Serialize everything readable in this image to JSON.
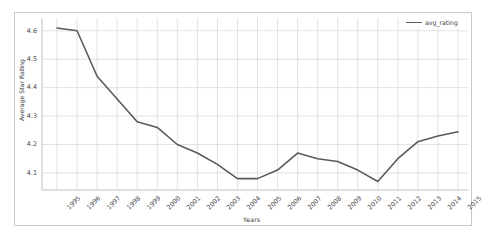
{
  "chart_data": {
    "type": "line",
    "title": "",
    "xlabel": "Years",
    "ylabel": "Average Star Rating",
    "categories": [
      "1995",
      "1996",
      "1997",
      "1998",
      "1999",
      "2000",
      "2001",
      "2002",
      "2003",
      "2004",
      "2005",
      "2006",
      "2007",
      "2008",
      "2009",
      "2010",
      "2011",
      "2012",
      "2013",
      "2014",
      "2015"
    ],
    "series": [
      {
        "name": "avg_rating",
        "color": "#5a5a5a",
        "values": [
          4.61,
          4.6,
          4.44,
          4.36,
          4.28,
          4.26,
          4.2,
          4.17,
          4.13,
          4.08,
          4.08,
          4.11,
          4.17,
          4.15,
          4.14,
          4.11,
          4.07,
          4.15,
          4.21,
          4.23,
          4.245
        ]
      }
    ],
    "ylim": [
      4.04,
      4.645
    ],
    "yticks": [
      4.1,
      4.2,
      4.3,
      4.4,
      4.5,
      4.6
    ],
    "ytick_labels": [
      "4.1",
      "4.2",
      "4.3",
      "4.4",
      "4.5",
      "4.6"
    ],
    "grid": true,
    "grid_color": "#d5d5d5",
    "legend_position": "top-right",
    "legend_entries": [
      "avg_rating"
    ]
  },
  "axes": {
    "x_title": "Years",
    "y_title": "Average Star Rating"
  },
  "legend": {
    "label": "avg_rating"
  }
}
